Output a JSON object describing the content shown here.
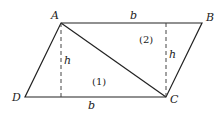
{
  "diagram": {
    "type": "parallelogram",
    "vertices": {
      "A": {
        "label": "A",
        "x": 61,
        "y": 23
      },
      "B": {
        "label": "B",
        "x": 202,
        "y": 23
      },
      "C": {
        "label": "C",
        "x": 166,
        "y": 97
      },
      "D": {
        "label": "D",
        "x": 25,
        "y": 97
      }
    },
    "diagonal": "AC",
    "sides": {
      "top": "b",
      "bottom": "b"
    },
    "heights": [
      "h",
      "h"
    ],
    "regions": [
      "(1)",
      "(2)"
    ],
    "stroke_color": "#222222"
  }
}
